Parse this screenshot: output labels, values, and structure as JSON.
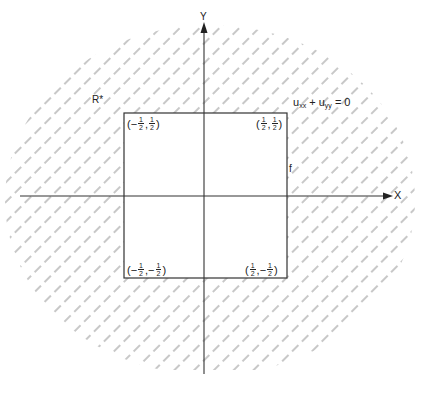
{
  "figure": {
    "axes": {
      "x_label": "X",
      "y_label": "Y"
    },
    "region_label": "R*",
    "equation": {
      "u": "u",
      "sub1": "xx",
      "plus": "+",
      "sub2": "yy",
      "rhs": "= 0"
    },
    "boundary_label": "f",
    "corners": [
      {
        "id": "top-left",
        "x_sign": "−",
        "x_num": "1",
        "x_den": "2",
        "y_sign": "",
        "y_num": "1",
        "y_den": "2"
      },
      {
        "id": "top-right",
        "x_sign": "",
        "x_num": "1",
        "x_den": "2",
        "y_sign": "",
        "y_num": "1",
        "y_den": "2"
      },
      {
        "id": "bottom-left",
        "x_sign": "−",
        "x_num": "1",
        "x_den": "2",
        "y_sign": "−",
        "y_num": "1",
        "y_den": "2"
      },
      {
        "id": "bottom-right",
        "x_sign": "",
        "x_num": "1",
        "x_den": "2",
        "y_sign": "−",
        "y_num": "1",
        "y_den": "2"
      }
    ],
    "colors": {
      "line": "#333333",
      "hatch": "#9a9a9a",
      "background": "#ffffff"
    }
  }
}
